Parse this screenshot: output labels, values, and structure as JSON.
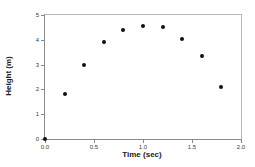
{
  "chart_data": {
    "type": "scatter",
    "title": "",
    "xlabel": "Time (sec)",
    "ylabel": "Height (m)",
    "xlim": [
      0.0,
      2.0
    ],
    "ylim": [
      0,
      5
    ],
    "grid": false,
    "legend": null,
    "x_ticks": [
      "0.0",
      "0.5",
      "1.0",
      "1.5",
      "2.0"
    ],
    "x_tick_values": [
      0.0,
      0.5,
      1.0,
      1.5,
      2.0
    ],
    "y_ticks": [
      "0",
      "1",
      "2",
      "3",
      "4",
      "5"
    ],
    "y_tick_values": [
      0,
      1,
      2,
      3,
      4,
      5
    ],
    "marker": "filled-circle",
    "marker_color": "#111111",
    "x": [
      0.0,
      0.2,
      0.4,
      0.6,
      0.8,
      1.0,
      1.2,
      1.4,
      1.6,
      1.8
    ],
    "values": [
      0.0,
      1.8,
      3.0,
      3.9,
      4.4,
      4.55,
      4.5,
      4.05,
      3.35,
      2.1
    ],
    "points": [
      {
        "x": 0.0,
        "y": 0.0
      },
      {
        "x": 0.2,
        "y": 1.8
      },
      {
        "x": 0.4,
        "y": 3.0
      },
      {
        "x": 0.6,
        "y": 3.9
      },
      {
        "x": 0.8,
        "y": 4.4
      },
      {
        "x": 1.0,
        "y": 4.55
      },
      {
        "x": 1.2,
        "y": 4.5
      },
      {
        "x": 1.4,
        "y": 4.05
      },
      {
        "x": 1.6,
        "y": 3.35
      },
      {
        "x": 1.8,
        "y": 2.1
      }
    ]
  }
}
